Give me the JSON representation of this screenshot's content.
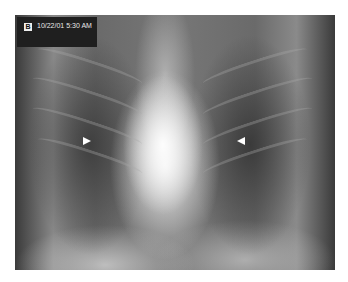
{
  "image": {
    "type": "chest-xray",
    "label": {
      "panel_letter": "B",
      "timestamp": "10/22/01 5:30 AM"
    },
    "annotations": [
      {
        "type": "arrowhead",
        "direction": "right",
        "side": "left-lung"
      },
      {
        "type": "arrowhead",
        "direction": "left",
        "side": "right-lung"
      }
    ]
  }
}
